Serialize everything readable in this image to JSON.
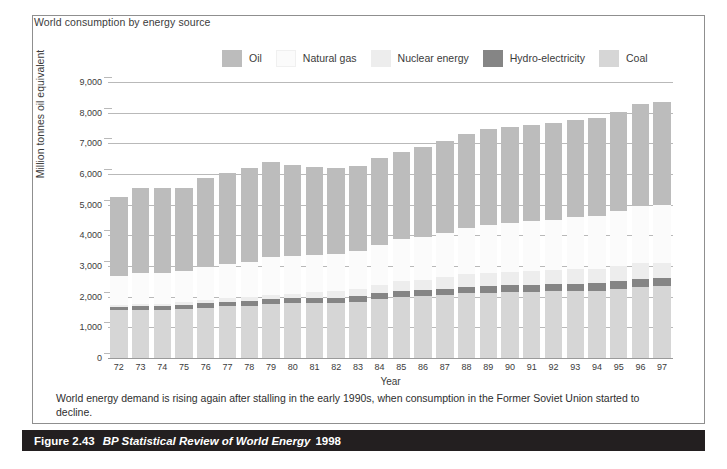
{
  "figure": {
    "heading": "World consumption by energy source",
    "footnote": "World energy demand is rising again after stalling in the early 1990s, when consumption in the Former Soviet Union started to decline.",
    "caption_number": "Figure 2.43",
    "caption_title": "BP Statistical Review of World Energy",
    "caption_year": "1998"
  },
  "colors": {
    "oil": "#bcbcbc",
    "natural_gas": "#fbfbfb",
    "nuclear_energy": "#ededed",
    "hydro_electricity": "#858585",
    "coal": "#d6d6d6",
    "gridline": "#b9b9b9",
    "frame": "#8f8f8f",
    "caption_bar": "#231f20",
    "text": "#3b3b3b"
  },
  "chart_data": {
    "type": "bar",
    "stacked": true,
    "title": "World consumption by energy source",
    "xlabel": "Year",
    "ylabel": "Million tonnes oil equivalent",
    "ylim": [
      0,
      9000
    ],
    "yticks": [
      "0",
      "1,000",
      "2,000",
      "3,000",
      "4,000",
      "5,000",
      "6,000",
      "7,000",
      "8,000",
      "9,000"
    ],
    "ytick_values": [
      0,
      1000,
      2000,
      3000,
      4000,
      5000,
      6000,
      7000,
      8000,
      9000
    ],
    "grid": true,
    "legend_position": "top",
    "categories": [
      "72",
      "73",
      "74",
      "75",
      "76",
      "77",
      "78",
      "79",
      "80",
      "81",
      "82",
      "83",
      "84",
      "85",
      "86",
      "87",
      "88",
      "89",
      "90",
      "91",
      "92",
      "93",
      "94",
      "95",
      "96",
      "97"
    ],
    "series": [
      {
        "name": "Coal",
        "color": "#d6d6d6",
        "values": [
          1560,
          1580,
          1580,
          1600,
          1640,
          1680,
          1700,
          1760,
          1780,
          1790,
          1800,
          1840,
          1920,
          1990,
          2010,
          2060,
          2110,
          2130,
          2150,
          2160,
          2170,
          2190,
          2200,
          2260,
          2330,
          2340
        ]
      },
      {
        "name": "Hydro-electricity",
        "color": "#858585",
        "values": [
          120,
          125,
          132,
          136,
          142,
          146,
          152,
          158,
          162,
          166,
          172,
          178,
          186,
          194,
          198,
          204,
          212,
          216,
          220,
          224,
          228,
          234,
          240,
          246,
          250,
          254
        ]
      },
      {
        "name": "Nuclear energy",
        "color": "#ededed",
        "values": [
          40,
          52,
          62,
          84,
          98,
          118,
          132,
          142,
          158,
          186,
          198,
          226,
          272,
          320,
          346,
          374,
          414,
          424,
          438,
          452,
          460,
          468,
          478,
          492,
          510,
          512
        ]
      },
      {
        "name": "Natural gas",
        "color": "#fbfbfb",
        "values": [
          970,
          1000,
          1010,
          1020,
          1080,
          1120,
          1160,
          1220,
          1230,
          1230,
          1220,
          1240,
          1320,
          1370,
          1390,
          1440,
          1510,
          1570,
          1610,
          1640,
          1650,
          1700,
          1720,
          1800,
          1880,
          1900
        ]
      },
      {
        "name": "Oil",
        "color": "#bcbcbc",
        "values": [
          2560,
          2790,
          2750,
          2690,
          2900,
          2980,
          3060,
          3120,
          2980,
          2870,
          2800,
          2780,
          2840,
          2840,
          2940,
          3000,
          3070,
          3120,
          3130,
          3130,
          3160,
          3160,
          3200,
          3240,
          3300,
          3350
        ]
      }
    ],
    "totals": [
      5250,
      5547,
      5534,
      5530,
      5860,
      6044,
      6204,
      6400,
      6310,
      6242,
      6190,
      6264,
      6538,
      6714,
      6884,
      7078,
      7316,
      7460,
      7548,
      7606,
      7668,
      7752,
      7838,
      8038,
      8270,
      8356
    ]
  },
  "legend": {
    "items": [
      {
        "label": "Oil",
        "color": "#bcbcbc",
        "icon": "legend-swatch-oil"
      },
      {
        "label": "Natural gas",
        "color": "#fbfbfb",
        "icon": "legend-swatch-natural-gas"
      },
      {
        "label": "Nuclear energy",
        "color": "#ededed",
        "icon": "legend-swatch-nuclear-energy"
      },
      {
        "label": "Hydro-electricity",
        "color": "#858585",
        "icon": "legend-swatch-hydro-electricity"
      },
      {
        "label": "Coal",
        "color": "#d6d6d6",
        "icon": "legend-swatch-coal"
      }
    ]
  }
}
